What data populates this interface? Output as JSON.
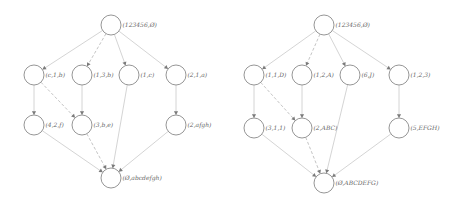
{
  "diagrams": [
    {
      "name": "left-lattice",
      "nodes": [
        {
          "id": "root",
          "label": "(123456,Ø)",
          "x": 111,
          "y": 25
        },
        {
          "id": "a1",
          "label": "(c,1,b)",
          "x": 34,
          "y": 75
        },
        {
          "id": "a2",
          "label": "(1,3,b)",
          "x": 82,
          "y": 75
        },
        {
          "id": "a3",
          "label": "(1,c)",
          "x": 129,
          "y": 75
        },
        {
          "id": "a4",
          "label": "(2,1,a)",
          "x": 176,
          "y": 75
        },
        {
          "id": "b1",
          "label": "(4,2,f)",
          "x": 34,
          "y": 125
        },
        {
          "id": "b2",
          "label": "(3,b,e)",
          "x": 82,
          "y": 125
        },
        {
          "id": "b3",
          "label": "(2,afgh)",
          "x": 176,
          "y": 125
        },
        {
          "id": "bottom",
          "label": "(Ø,abcdefgh)",
          "x": 111,
          "y": 178
        }
      ],
      "edges": [
        {
          "from": "root",
          "to": "a1",
          "style": "solid"
        },
        {
          "from": "root",
          "to": "a2",
          "style": "dashed"
        },
        {
          "from": "root",
          "to": "a3",
          "style": "solid"
        },
        {
          "from": "root",
          "to": "a4",
          "style": "solid"
        },
        {
          "from": "a1",
          "to": "b1",
          "style": "solid"
        },
        {
          "from": "a1",
          "to": "b2",
          "style": "dashed"
        },
        {
          "from": "a2",
          "to": "b2",
          "style": "solid"
        },
        {
          "from": "a3",
          "to": "bottom",
          "style": "solid"
        },
        {
          "from": "a4",
          "to": "b3",
          "style": "solid"
        },
        {
          "from": "b1",
          "to": "bottom",
          "style": "solid"
        },
        {
          "from": "b2",
          "to": "bottom",
          "style": "dashed"
        },
        {
          "from": "b3",
          "to": "bottom",
          "style": "solid"
        }
      ]
    },
    {
      "name": "right-lattice",
      "nodes": [
        {
          "id": "root",
          "label": "(123456,Ø)",
          "x": 324,
          "y": 25
        },
        {
          "id": "a1",
          "label": "(1,1,D)",
          "x": 254,
          "y": 75
        },
        {
          "id": "a2",
          "label": "(1,2,A)",
          "x": 302,
          "y": 75
        },
        {
          "id": "a3",
          "label": "(6,J)",
          "x": 350,
          "y": 75
        },
        {
          "id": "a4",
          "label": "(1,2,3)",
          "x": 399,
          "y": 75
        },
        {
          "id": "b1",
          "label": "(3,1,1)",
          "x": 254,
          "y": 128
        },
        {
          "id": "b2",
          "label": "(2,ABC)",
          "x": 302,
          "y": 128
        },
        {
          "id": "b3",
          "label": "(5,EFGH)",
          "x": 399,
          "y": 128
        },
        {
          "id": "bottom",
          "label": "(Ø,ABCDEFG)",
          "x": 324,
          "y": 183
        }
      ],
      "edges": [
        {
          "from": "root",
          "to": "a1",
          "style": "solid"
        },
        {
          "from": "root",
          "to": "a2",
          "style": "dashed"
        },
        {
          "from": "root",
          "to": "a3",
          "style": "solid"
        },
        {
          "from": "root",
          "to": "a4",
          "style": "solid"
        },
        {
          "from": "a1",
          "to": "b1",
          "style": "solid"
        },
        {
          "from": "a1",
          "to": "b2",
          "style": "dashed"
        },
        {
          "from": "a2",
          "to": "b2",
          "style": "solid"
        },
        {
          "from": "a3",
          "to": "bottom",
          "style": "solid"
        },
        {
          "from": "a4",
          "to": "b3",
          "style": "solid"
        },
        {
          "from": "b1",
          "to": "bottom",
          "style": "solid"
        },
        {
          "from": "b2",
          "to": "bottom",
          "style": "dashed"
        },
        {
          "from": "b3",
          "to": "bottom",
          "style": "solid"
        }
      ]
    }
  ],
  "style": {
    "node_radius": 10,
    "node_stroke": "#8a8a8a",
    "edge_color": "#cfcfcf",
    "arrow_color": "#7a7a7a",
    "label_color": "#666666"
  }
}
